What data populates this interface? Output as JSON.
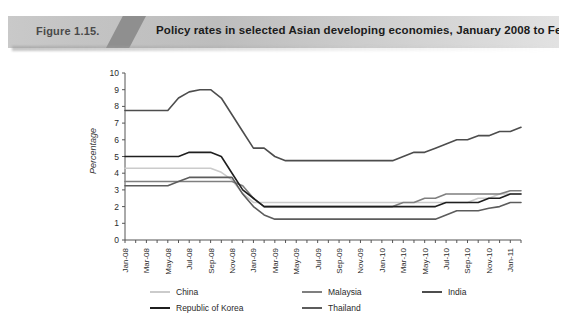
{
  "header": {
    "figure_number": "Figure 1.15.",
    "title": "Policy rates in selected Asian developing economies, January 2008 to February 2011"
  },
  "chart_data": {
    "type": "line",
    "title": "Policy rates in selected Asian developing economies, January 2008 to February 2011",
    "xlabel": "",
    "ylabel": "Percentage",
    "ylim": [
      0,
      10
    ],
    "ytick_values": [
      0,
      1,
      2,
      3,
      4,
      5,
      6,
      7,
      8,
      9,
      10
    ],
    "grid": false,
    "legend_position": "bottom",
    "x": [
      "Jan-08",
      "Feb-08",
      "Mar-08",
      "Apr-08",
      "May-08",
      "Jun-08",
      "Jul-08",
      "Aug-08",
      "Sep-08",
      "Oct-08",
      "Nov-08",
      "Dec-08",
      "Jan-09",
      "Feb-09",
      "Mar-09",
      "Apr-09",
      "May-09",
      "Jun-09",
      "Jul-09",
      "Aug-09",
      "Sep-09",
      "Oct-09",
      "Nov-09",
      "Dec-09",
      "Jan-10",
      "Feb-10",
      "Mar-10",
      "Apr-10",
      "May-10",
      "Jun-10",
      "Jul-10",
      "Aug-10",
      "Sep-10",
      "Oct-10",
      "Nov-10",
      "Dec-10",
      "Jan-11",
      "Feb-11"
    ],
    "xtick_labels": [
      "Jan-08",
      "Mar-08",
      "May-08",
      "Jul-08",
      "Sep-08",
      "Nov-08",
      "Jan-09",
      "Mar-09",
      "May-09",
      "Jul-09",
      "Sep-09",
      "Nov-09",
      "Jan-10",
      "Mar-10",
      "May-10",
      "Jul-10",
      "Sep-10",
      "Nov-10",
      "Jan-11"
    ],
    "series": [
      {
        "name": "China",
        "color": "#cbcbcb",
        "values": [
          4.3,
          4.3,
          4.3,
          4.3,
          4.3,
          4.3,
          4.3,
          4.3,
          4.3,
          4.05,
          3.6,
          2.79,
          2.25,
          2.25,
          2.25,
          2.25,
          2.25,
          2.25,
          2.25,
          2.25,
          2.25,
          2.25,
          2.25,
          2.25,
          2.25,
          2.25,
          2.25,
          2.25,
          2.25,
          2.25,
          2.25,
          2.25,
          2.25,
          2.5,
          2.5,
          2.75,
          2.75,
          2.75
        ]
      },
      {
        "name": "Malaysia",
        "color": "#7f7f7f",
        "values": [
          3.5,
          3.5,
          3.5,
          3.5,
          3.5,
          3.5,
          3.5,
          3.5,
          3.5,
          3.5,
          3.5,
          3.25,
          2.5,
          2.0,
          2.0,
          2.0,
          2.0,
          2.0,
          2.0,
          2.0,
          2.0,
          2.0,
          2.0,
          2.0,
          2.0,
          2.0,
          2.25,
          2.25,
          2.5,
          2.5,
          2.75,
          2.75,
          2.75,
          2.75,
          2.75,
          2.75,
          2.95,
          2.95
        ]
      },
      {
        "name": "India",
        "color": "#4d4d4d",
        "values": [
          7.75,
          7.75,
          7.75,
          7.75,
          7.75,
          8.5,
          8.87,
          9.0,
          9.0,
          8.5,
          7.5,
          6.5,
          5.5,
          5.5,
          5.0,
          4.75,
          4.75,
          4.75,
          4.75,
          4.75,
          4.75,
          4.75,
          4.75,
          4.75,
          4.75,
          4.75,
          5.0,
          5.25,
          5.25,
          5.5,
          5.75,
          6.0,
          6.0,
          6.25,
          6.25,
          6.5,
          6.5,
          6.75
        ]
      },
      {
        "name": "Republic of Korea",
        "color": "#1f1f1f",
        "values": [
          5.0,
          5.0,
          5.0,
          5.0,
          5.0,
          5.0,
          5.25,
          5.25,
          5.25,
          5.0,
          4.0,
          3.0,
          2.5,
          2.0,
          2.0,
          2.0,
          2.0,
          2.0,
          2.0,
          2.0,
          2.0,
          2.0,
          2.0,
          2.0,
          2.0,
          2.0,
          2.0,
          2.0,
          2.0,
          2.0,
          2.25,
          2.25,
          2.25,
          2.25,
          2.5,
          2.5,
          2.75,
          2.75
        ]
      },
      {
        "name": "Thailand",
        "color": "#5c5c5c",
        "values": [
          3.25,
          3.25,
          3.25,
          3.25,
          3.25,
          3.5,
          3.75,
          3.75,
          3.75,
          3.75,
          3.75,
          2.75,
          2.0,
          1.5,
          1.25,
          1.25,
          1.25,
          1.25,
          1.25,
          1.25,
          1.25,
          1.25,
          1.25,
          1.25,
          1.25,
          1.25,
          1.25,
          1.25,
          1.25,
          1.25,
          1.5,
          1.75,
          1.75,
          1.75,
          1.9,
          2.0,
          2.25,
          2.25
        ]
      }
    ]
  },
  "legend": {
    "items": [
      {
        "label": "China",
        "color": "#cbcbcb"
      },
      {
        "label": "Malaysia",
        "color": "#7f7f7f"
      },
      {
        "label": "India",
        "color": "#4d4d4d"
      },
      {
        "label": "Republic of Korea",
        "color": "#1f1f1f"
      },
      {
        "label": "Thailand",
        "color": "#5c5c5c"
      }
    ]
  }
}
